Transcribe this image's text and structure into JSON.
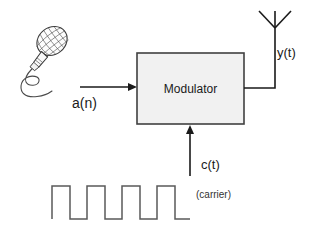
{
  "diagram": {
    "block": {
      "label": "Modulator",
      "fill_color": "#f1f1f1",
      "stroke_color": "#404040",
      "x": 137,
      "y": 53,
      "width": 107,
      "height": 71
    },
    "signals": {
      "input_label": "a(n)",
      "carrier_label": "c(t)",
      "carrier_note": "(carrier)",
      "output_label": "y(t)"
    },
    "source_icon": "microphone-icon",
    "output_icon": "antenna-icon",
    "waveform": {
      "name": "square-wave",
      "type": "square",
      "pulses": 4,
      "stroke_color": "#5a5a5a",
      "x_start": 52,
      "x_end": 190,
      "y_high": 186,
      "y_low": 219
    },
    "arrows": {
      "input_arrow": {
        "x1": 80,
        "y1": 87,
        "x2": 136,
        "y2": 87
      },
      "carrier_arrow": {
        "x1": 190,
        "y1": 176,
        "x2": 190,
        "y2": 126
      },
      "output_line": {
        "x1": 244,
        "y1": 88,
        "x2": 275,
        "y2": 88,
        "x3": 275,
        "y3": 28
      }
    }
  }
}
